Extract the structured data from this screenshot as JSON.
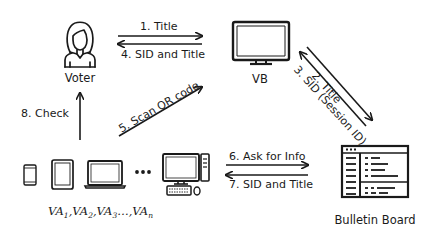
{
  "diagram": {
    "type": "protocol-flow",
    "nodes": {
      "voter": {
        "label": "Voter",
        "icon": "person-icon"
      },
      "vb": {
        "label": "VB",
        "icon": "monitor-icon"
      },
      "bulletin_board": {
        "label": "Bulletin Board",
        "icon": "bulletin-board-icon"
      },
      "devices": {
        "icons": [
          "smartphone-icon",
          "tablet-icon",
          "laptop-icon",
          "ellipsis-icon",
          "desktop-computer-icon"
        ],
        "label_base": "VA",
        "label_items": [
          {
            "base": "VA",
            "sub": "1"
          },
          {
            "base": "VA",
            "sub": "2"
          },
          {
            "base": "VA",
            "sub": "3"
          },
          {
            "base": "VA",
            "sub": "n"
          }
        ]
      }
    },
    "edges": [
      {
        "step": 1,
        "label": "1. Title",
        "from": "Voter",
        "to": "VB"
      },
      {
        "step": 2,
        "label": "2. Title",
        "from": "VB",
        "to": "Bulletin Board"
      },
      {
        "step": 3,
        "label": "3. SID (Session ID)",
        "from": "Bulletin Board",
        "to": "VB"
      },
      {
        "step": 4,
        "label": "4. SID and Title",
        "from": "VB",
        "to": "Voter"
      },
      {
        "step": 5,
        "label": "5. Scan QR code",
        "from": "VA devices",
        "to": "VB"
      },
      {
        "step": 6,
        "label": "6. Ask for Info",
        "from": "VA devices",
        "to": "Bulletin Board"
      },
      {
        "step": 7,
        "label": "7. SID and Title",
        "from": "Bulletin Board",
        "to": "VA devices"
      },
      {
        "step": 8,
        "label": "8. Check",
        "from": "VA devices",
        "to": "Voter"
      }
    ]
  },
  "colors": {
    "stroke": "#1a1a1a",
    "background": "#ffffff"
  }
}
